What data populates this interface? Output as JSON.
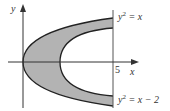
{
  "diagram": {
    "axes": {
      "x_label": "x",
      "y_label": "y",
      "tick_label": "5"
    },
    "curves": [
      {
        "name": "outer",
        "equation": "y² = x",
        "lhs": "y",
        "exp": "2",
        "rhs": " = x"
      },
      {
        "name": "inner",
        "equation": "y² = x − 2",
        "lhs": "y",
        "exp": "2",
        "rhs": " = x − 2"
      }
    ],
    "region": {
      "bounded_by": [
        "y² = x",
        "y² = x − 2",
        "x = 5"
      ],
      "fill": "#b3b3b3"
    },
    "colors": {
      "axis": "#333333",
      "curve": "#222222",
      "fill": "#b3b3b3"
    }
  }
}
